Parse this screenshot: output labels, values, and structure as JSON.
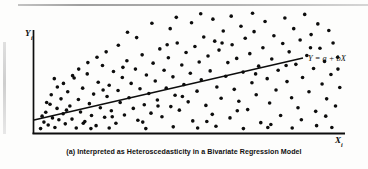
{
  "figure": {
    "caption": "(a) Interpreted as Heteroscedasticity in a Bivariate Regression Model",
    "y_axis_label": "Y",
    "y_axis_subscript": "i",
    "x_axis_label": "X",
    "x_axis_subscript": "i",
    "regression_label": "Y = a + bX",
    "ink_color": "#0d0d0d",
    "background_color": "#fdfdfc"
  },
  "chart_data": {
    "type": "scatter",
    "title": "(a) Interpreted as Heteroscedasticity in a Bivariate Regression Model",
    "xlabel": "Xi",
    "ylabel": "Yi",
    "grid": false,
    "legend": "none",
    "xlim": [
      0,
      100
    ],
    "ylim": [
      0,
      100
    ],
    "annotations": [
      {
        "text": "Y = a + bX",
        "x": 101,
        "y": 69,
        "style": "italic"
      }
    ],
    "series": [
      {
        "name": "Regression line",
        "type": "line",
        "equation": "Y = a + bX",
        "intercept": 14,
        "slope": 0.62,
        "x": [
          0,
          100
        ],
        "y": [
          14,
          76
        ]
      },
      {
        "name": "Observations",
        "type": "scatter",
        "marker": "filled-circle",
        "marker_size_px": 3.6,
        "color": "#0d0d0d",
        "note": "Variance of residuals increases with X (fan / cone shape) - heteroscedasticity",
        "points": [
          [
            1.5,
            2.0
          ],
          [
            2.6,
            7.5
          ],
          [
            3.2,
            15.8
          ],
          [
            4.0,
            5.0
          ],
          [
            4.6,
            22.5
          ],
          [
            5.4,
            11.0
          ],
          [
            6.2,
            3.0
          ],
          [
            6.9,
            19.0
          ],
          [
            7.5,
            9.5
          ],
          [
            8.2,
            27.0
          ],
          [
            8.9,
            14.5
          ],
          [
            9.6,
            6.0
          ],
          [
            10.4,
            33.0
          ],
          [
            11.1,
            21.0
          ],
          [
            11.8,
            10.0
          ],
          [
            12.5,
            44.5
          ],
          [
            13.2,
            2.5
          ],
          [
            13.9,
            26.5
          ],
          [
            14.6,
            16.0
          ],
          [
            15.3,
            36.0
          ],
          [
            16.0,
            8.0
          ],
          [
            16.8,
            48.0
          ],
          [
            17.5,
            23.0
          ],
          [
            18.2,
            13.0
          ],
          [
            18.9,
            31.0
          ],
          [
            19.7,
            4.5
          ],
          [
            20.4,
            41.0
          ],
          [
            21.1,
            19.5
          ],
          [
            21.8,
            55.0
          ],
          [
            22.5,
            11.5
          ],
          [
            23.3,
            29.0
          ],
          [
            24.0,
            38.5
          ],
          [
            24.7,
            17.0
          ],
          [
            25.4,
            50.0
          ],
          [
            26.2,
            6.5
          ],
          [
            26.9,
            34.0
          ],
          [
            27.6,
            24.0
          ],
          [
            28.3,
            45.0
          ],
          [
            29.0,
            13.5
          ],
          [
            29.8,
            59.0
          ],
          [
            30.5,
            28.0
          ],
          [
            31.2,
            40.0
          ],
          [
            31.9,
            19.0
          ],
          [
            32.6,
            52.0
          ],
          [
            33.4,
            9.0
          ],
          [
            34.1,
            35.5
          ],
          [
            34.8,
            64.0
          ],
          [
            35.5,
            22.0
          ],
          [
            36.2,
            47.0
          ],
          [
            37.0,
            31.5
          ],
          [
            37.7,
            15.0
          ],
          [
            38.4,
            57.0
          ],
          [
            39.1,
            42.0
          ],
          [
            39.8,
            26.0
          ],
          [
            40.6,
            69.0
          ],
          [
            41.3,
            12.0
          ],
          [
            42.0,
            51.0
          ],
          [
            42.7,
            36.0
          ],
          [
            43.4,
            61.5
          ],
          [
            44.2,
            20.5
          ],
          [
            44.9,
            45.5
          ],
          [
            45.6,
            30.0
          ],
          [
            46.3,
            74.0
          ],
          [
            47.0,
            17.5
          ],
          [
            47.8,
            55.5
          ],
          [
            48.5,
            39.0
          ],
          [
            49.2,
            66.0
          ],
          [
            49.9,
            24.5
          ],
          [
            50.6,
            48.5
          ],
          [
            51.4,
            8.5
          ],
          [
            52.1,
            71.0
          ],
          [
            52.8,
            33.5
          ],
          [
            53.5,
            58.0
          ],
          [
            54.2,
            43.0
          ],
          [
            55.0,
            79.0
          ],
          [
            55.7,
            21.5
          ],
          [
            56.4,
            63.0
          ],
          [
            57.1,
            50.5
          ],
          [
            57.8,
            14.0
          ],
          [
            58.6,
            75.5
          ],
          [
            59.3,
            37.0
          ],
          [
            60.0,
            68.0
          ],
          [
            60.7,
            27.5
          ],
          [
            61.4,
            84.0
          ],
          [
            62.2,
            46.0
          ],
          [
            62.9,
            57.5
          ],
          [
            63.6,
            11.0
          ],
          [
            64.3,
            72.5
          ],
          [
            65.0,
            35.0
          ],
          [
            65.8,
            61.0
          ],
          [
            66.5,
            25.0
          ],
          [
            67.2,
            88.0
          ],
          [
            67.9,
            49.5
          ],
          [
            68.6,
            78.0
          ],
          [
            69.4,
            18.0
          ],
          [
            70.1,
            65.0
          ],
          [
            70.8,
            40.5
          ],
          [
            71.5,
            83.5
          ],
          [
            72.2,
            30.5
          ],
          [
            73.0,
            54.5
          ],
          [
            73.7,
            7.0
          ],
          [
            74.4,
            70.0
          ],
          [
            75.1,
            92.0
          ],
          [
            75.8,
            44.0
          ],
          [
            76.6,
            23.5
          ],
          [
            77.3,
            60.5
          ],
          [
            78.0,
            80.0
          ],
          [
            78.7,
            34.5
          ],
          [
            79.4,
            51.0
          ],
          [
            80.2,
            13.0
          ],
          [
            80.9,
            73.5
          ],
          [
            81.6,
            95.0
          ],
          [
            82.3,
            41.5
          ],
          [
            83.0,
            66.5
          ],
          [
            83.8,
            28.0
          ],
          [
            84.5,
            86.0
          ],
          [
            85.2,
            56.0
          ],
          [
            85.9,
            19.5
          ],
          [
            86.6,
            76.5
          ],
          [
            87.4,
            45.0
          ],
          [
            88.1,
            98.0
          ],
          [
            88.8,
            63.5
          ],
          [
            89.5,
            33.0
          ],
          [
            90.2,
            81.0
          ],
          [
            91.0,
            52.5
          ],
          [
            91.7,
            16.5
          ],
          [
            92.4,
            90.0
          ],
          [
            93.1,
            69.5
          ],
          [
            93.8,
            39.5
          ],
          [
            94.6,
            58.5
          ],
          [
            95.3,
            27.0
          ],
          [
            96.0,
            84.5
          ],
          [
            96.7,
            47.5
          ],
          [
            97.4,
            74.0
          ],
          [
            98.2,
            21.0
          ],
          [
            98.9,
            62.0
          ],
          [
            99.6,
            36.5
          ],
          [
            5.0,
            30.5
          ],
          [
            9.0,
            40.0
          ],
          [
            14.0,
            52.0
          ],
          [
            20.0,
            62.0
          ],
          [
            27.0,
            72.0
          ],
          [
            33.0,
            78.5
          ],
          [
            44.0,
            86.0
          ],
          [
            51.0,
            91.0
          ],
          [
            58.0,
            94.0
          ],
          [
            64.0,
            96.5
          ],
          [
            71.0,
            99.0
          ],
          [
            7.0,
            37.0
          ],
          [
            12.0,
            46.5
          ],
          [
            17.0,
            57.5
          ],
          [
            23.0,
            66.5
          ],
          [
            30.0,
            83.0
          ],
          [
            38.0,
            90.5
          ],
          [
            46.0,
            95.5
          ],
          [
            54.0,
            98.5
          ],
          [
            3.5,
            24.0
          ],
          [
            2.0,
            12.5
          ],
          [
            10.0,
            17.5
          ],
          [
            15.5,
            6.5
          ],
          [
            22.0,
            34.5
          ],
          [
            25.0,
            12.0
          ],
          [
            28.5,
            53.5
          ],
          [
            35.0,
            7.5
          ],
          [
            40.0,
            21.0
          ],
          [
            43.0,
            72.5
          ],
          [
            48.0,
            29.0
          ],
          [
            56.0,
            8.0
          ],
          [
            61.0,
            74.0
          ],
          [
            66.0,
            17.0
          ],
          [
            72.0,
            48.0
          ],
          [
            77.0,
            5.5
          ],
          [
            82.0,
            55.0
          ],
          [
            87.0,
            9.5
          ],
          [
            90.0,
            70.0
          ],
          [
            95.0,
            12.5
          ],
          [
            99.0,
            52.0
          ],
          [
            6.0,
            44.0
          ],
          [
            18.0,
            2.0
          ],
          [
            24.0,
            2.5
          ],
          [
            36.0,
            2.0
          ],
          [
            45.0,
            3.5
          ],
          [
            53.0,
            2.5
          ],
          [
            59.0,
            4.0
          ],
          [
            68.0,
            2.0
          ],
          [
            76.0,
            3.0
          ],
          [
            84.0,
            2.5
          ],
          [
            92.0,
            4.5
          ],
          [
            97.0,
            3.0
          ]
        ]
      }
    ]
  }
}
